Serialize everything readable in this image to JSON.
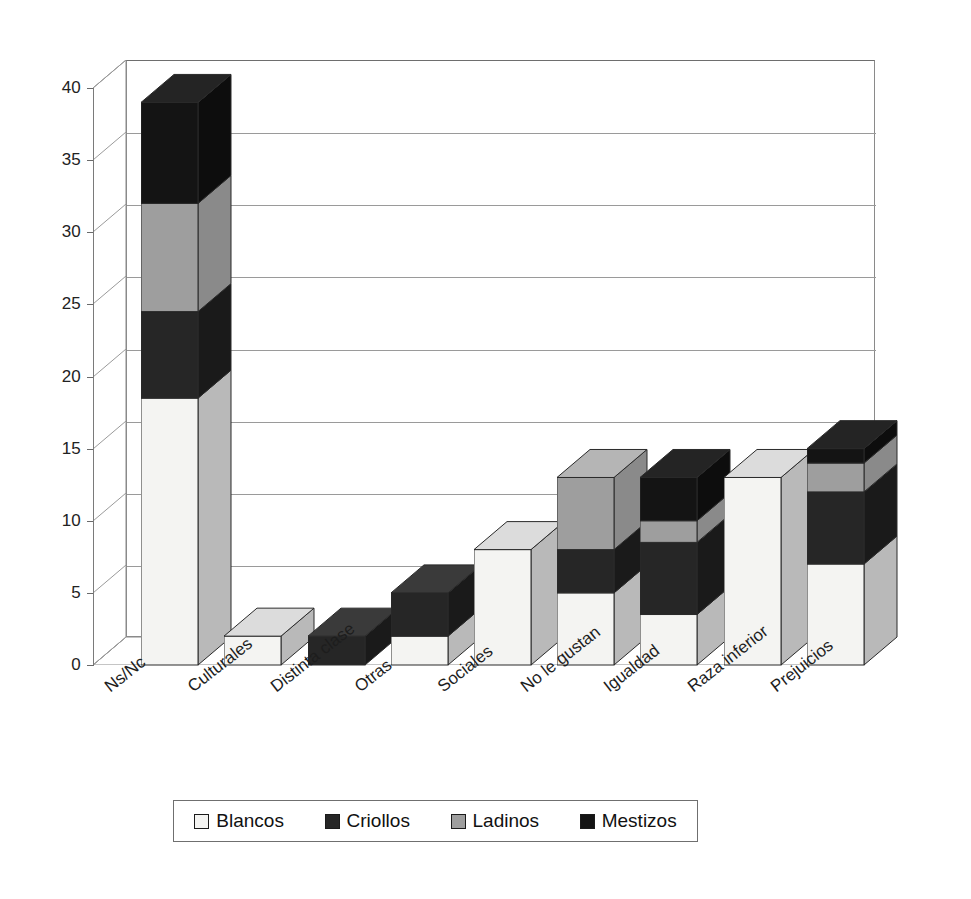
{
  "chart_data": {
    "type": "bar",
    "subtype": "stacked-column-3d",
    "title": "",
    "xlabel": "",
    "ylabel": "",
    "ylim": [
      0,
      40
    ],
    "ytick_step": 5,
    "yticks": [
      0,
      5,
      10,
      15,
      20,
      25,
      30,
      35,
      40
    ],
    "grid": true,
    "legend_position": "bottom",
    "categories": [
      "Ns/Nc",
      "Culturales",
      "Distinta clase",
      "Otras",
      "Sociales",
      "No le gustan",
      "Igualdad",
      "Raza inferior",
      "Prejuicios"
    ],
    "series": [
      {
        "name": "Blancos",
        "color": "#f2f2f0",
        "values": [
          18.5,
          2,
          0,
          2,
          8,
          5,
          3.5,
          13,
          7
        ]
      },
      {
        "name": "Criollos",
        "color": "#262626",
        "values": [
          6,
          0,
          2,
          3,
          0,
          3,
          5,
          0,
          5
        ]
      },
      {
        "name": "Ladinos",
        "color": "#9e9e9e",
        "values": [
          7.5,
          0,
          0,
          0,
          0,
          5,
          1.5,
          0,
          2
        ]
      },
      {
        "name": "Mestizos",
        "color": "#141414",
        "values": [
          7,
          0,
          0,
          0,
          0,
          0,
          3,
          0,
          1
        ]
      }
    ],
    "totals": [
      39,
      2,
      2,
      5,
      8,
      13,
      13,
      13,
      15
    ]
  },
  "legend": {
    "items": [
      {
        "label": "Blancos"
      },
      {
        "label": "Criollos"
      },
      {
        "label": "Ladinos"
      },
      {
        "label": "Mestizos"
      }
    ]
  }
}
